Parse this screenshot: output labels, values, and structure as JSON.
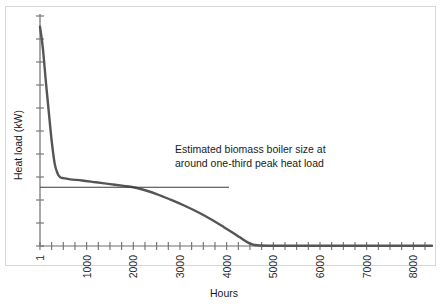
{
  "chart_data": {
    "type": "line",
    "title": "",
    "xlabel": "Hours",
    "ylabel": "Heat load (kW)",
    "xlim": [
      1,
      8400
    ],
    "ylim": [
      0,
      100
    ],
    "grid": false,
    "legend": null,
    "x_tick_labels": [
      "1",
      "1000",
      "2000",
      "3000",
      "4000",
      "5000",
      "6000",
      "7000",
      "8000"
    ],
    "x_tick_values": [
      1,
      1000,
      2000,
      3000,
      4000,
      5000,
      6000,
      7000,
      8000
    ],
    "x_minor_tick_interval": 250,
    "y_tick_labels": [],
    "y_tick_count": 11,
    "series": [
      {
        "name": "Heat load duration curve",
        "color": "#555555",
        "x": [
          1,
          60,
          130,
          200,
          260,
          320,
          380,
          430,
          500,
          650,
          900,
          1200,
          1500,
          1800,
          2000,
          2200,
          2500,
          2800,
          3100,
          3400,
          3700,
          3950,
          4150,
          4300,
          4450,
          4550,
          4650,
          5000,
          5600,
          6300,
          7000,
          7700,
          8400
        ],
        "y": [
          97,
          88,
          72,
          57,
          45,
          36,
          32,
          30.5,
          30,
          29.5,
          29,
          28.2,
          27.4,
          26.6,
          26,
          25,
          23,
          20.5,
          17.8,
          14.8,
          11.4,
          8.2,
          5.6,
          3.6,
          1.6,
          0.7,
          0.3,
          0.1,
          0.1,
          0.1,
          0.1,
          0.1,
          0.1
        ]
      }
    ],
    "annotations": [
      {
        "name": "boiler-size-line",
        "type": "hline",
        "y_value": 26,
        "x_start": 1,
        "x_end": 4050,
        "color": "#3a3a3a"
      },
      {
        "name": "boiler-size-label",
        "type": "text",
        "lines": [
          "Estimated biomass boiler size at",
          "around one-third peak heat load"
        ],
        "x_value": 2900,
        "y_value": 40
      }
    ]
  },
  "axes": {
    "y_title": "Heat load (kW)",
    "x_title": "Hours"
  },
  "ticks": {
    "x": [
      {
        "label": "1",
        "value": 1
      },
      {
        "label": "1000",
        "value": 1000
      },
      {
        "label": "2000",
        "value": 2000
      },
      {
        "label": "3000",
        "value": 3000
      },
      {
        "label": "4000",
        "value": 4000
      },
      {
        "label": "5000",
        "value": 5000
      },
      {
        "label": "6000",
        "value": 6000
      },
      {
        "label": "7000",
        "value": 7000
      },
      {
        "label": "8000",
        "value": 8000
      }
    ]
  },
  "annotation": {
    "line1": "Estimated biomass boiler size at",
    "line2": "around one-third peak heat load"
  },
  "colors": {
    "curve": "#555555",
    "axis": "#6e6e6e",
    "annotation": "#3a3a3a",
    "frame": "#d7d7d7",
    "background": "#ffffff"
  }
}
